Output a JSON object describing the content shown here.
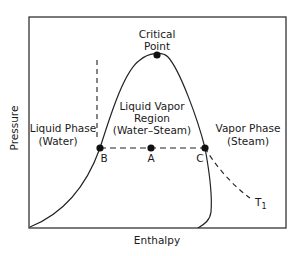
{
  "diagram": {
    "type": "pressure-enthalpy phase diagram",
    "axes": {
      "x_label": "Enthalpy",
      "y_label": "Pressure"
    },
    "regions": {
      "liquid": [
        "Liquid Phase",
        "(Water)"
      ],
      "two_phase": [
        "Liquid Vapor",
        "Region",
        "(Water–Steam)"
      ],
      "vapor": [
        "Vapor Phase",
        "(Steam)"
      ]
    },
    "critical_point": [
      "Critical",
      "Point"
    ],
    "points": {
      "B": "B",
      "A": "A",
      "C": "C"
    },
    "isotherm_label": "T",
    "isotherm_subscript": "1",
    "colors": {
      "line": "#1a1a1a",
      "background": "#ffffff"
    }
  }
}
